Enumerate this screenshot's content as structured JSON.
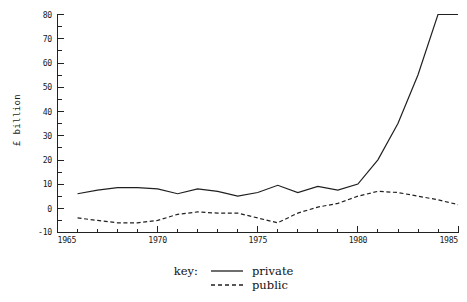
{
  "chart_data": {
    "type": "line",
    "title": "",
    "subtitle": "",
    "xlabel": "",
    "ylabel": "£ billion",
    "xlim": [
      1965,
      1985
    ],
    "ylim": [
      -10,
      80
    ],
    "xticks": [
      1965,
      1970,
      1975,
      1980,
      1985
    ],
    "xtick_labels": [
      "1965",
      "1970",
      "1975",
      "1980",
      "1985"
    ],
    "yticks": [
      -10,
      0,
      10,
      20,
      30,
      40,
      50,
      60,
      70,
      80
    ],
    "ytick_labels": [
      "-10",
      "0",
      "10",
      "20",
      "30",
      "40",
      "50",
      "60",
      "70",
      "80"
    ],
    "minor_xticks_every": 1,
    "minor_yticks_every": 5,
    "grid": false,
    "legend_position": "below-axes",
    "legend_title": "key:",
    "x": [
      1966,
      1967,
      1968,
      1969,
      1970,
      1971,
      1972,
      1973,
      1974,
      1975,
      1976,
      1977,
      1978,
      1979,
      1980,
      1981,
      1982,
      1983,
      1984,
      1985
    ],
    "series": [
      {
        "name": "private",
        "style": "solid",
        "values": [
          6.0,
          7.5,
          8.5,
          8.5,
          8.0,
          6.0,
          8.0,
          7.0,
          5.0,
          6.5,
          9.5,
          6.5,
          9.0,
          7.5,
          10.0,
          20.0,
          35.0,
          55.0,
          80.0,
          80.0
        ]
      },
      {
        "name": "public",
        "style": "dashed",
        "values": [
          -4.0,
          -5.0,
          -6.0,
          -6.0,
          -5.0,
          -2.5,
          -1.5,
          -2.0,
          -2.0,
          -4.0,
          -6.0,
          -2.0,
          0.5,
          2.0,
          5.0,
          7.0,
          6.5,
          5.0,
          3.5,
          1.5
        ]
      }
    ]
  },
  "axes": {
    "y_axis_title": "£ billion",
    "x_axis_origin_label": "1965"
  },
  "legend": {
    "title": "key:",
    "entries": [
      {
        "label": "private",
        "style": "solid"
      },
      {
        "label": "public",
        "style": "dashed"
      }
    ]
  }
}
